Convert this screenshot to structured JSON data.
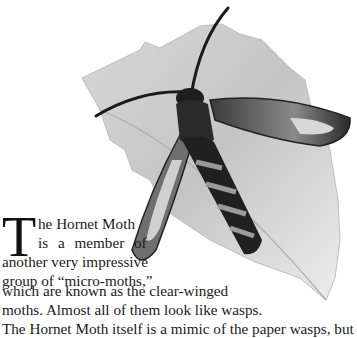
{
  "illustration": {
    "subject": "Hornet Moth resting on a leaf",
    "style": "grayscale natural-history illustration"
  },
  "article": {
    "drop_cap": "T",
    "lines": [
      "he Hornet Moth",
      "is a member of",
      "another very impressive",
      "group of “micro-moths,”",
      "which are known as the clear-winged",
      "moths. Almost all of them look like wasps.",
      "The Hornet Moth itself is a mimic of the paper wasps, but"
    ]
  }
}
